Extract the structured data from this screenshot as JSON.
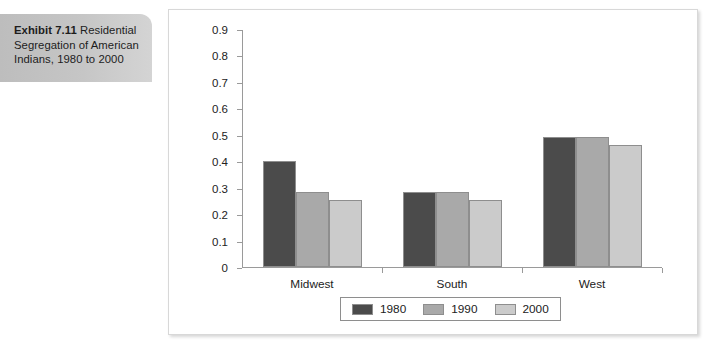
{
  "caption": {
    "lead": "Exhibit 7.11",
    "rest": " Residential Segregation of American Indians, 1980 to 2000"
  },
  "chart_data": {
    "type": "bar",
    "title": "",
    "xlabel": "",
    "ylabel": "",
    "categories": [
      "Midwest",
      "South",
      "West"
    ],
    "series": [
      {
        "name": "1980",
        "color": "#4b4b4b",
        "values": [
          0.4,
          0.285,
          0.49
        ]
      },
      {
        "name": "1990",
        "color": "#a9a9a9",
        "values": [
          0.285,
          0.283,
          0.49
        ]
      },
      {
        "name": "2000",
        "color": "#cbcbcb",
        "values": [
          0.255,
          0.252,
          0.46
        ]
      }
    ],
    "ylim": [
      0,
      0.9
    ],
    "ytick_labels": [
      "0.9",
      "0.8",
      "0.7",
      "0.6",
      "0.5",
      "0.4",
      "0.3",
      "0.2",
      "0.1",
      "0"
    ],
    "ytick_values": [
      0.9,
      0.8,
      0.7,
      0.6,
      0.5,
      0.4,
      0.3,
      0.2,
      0.1,
      0
    ],
    "grid": false,
    "legend_position": "bottom"
  }
}
